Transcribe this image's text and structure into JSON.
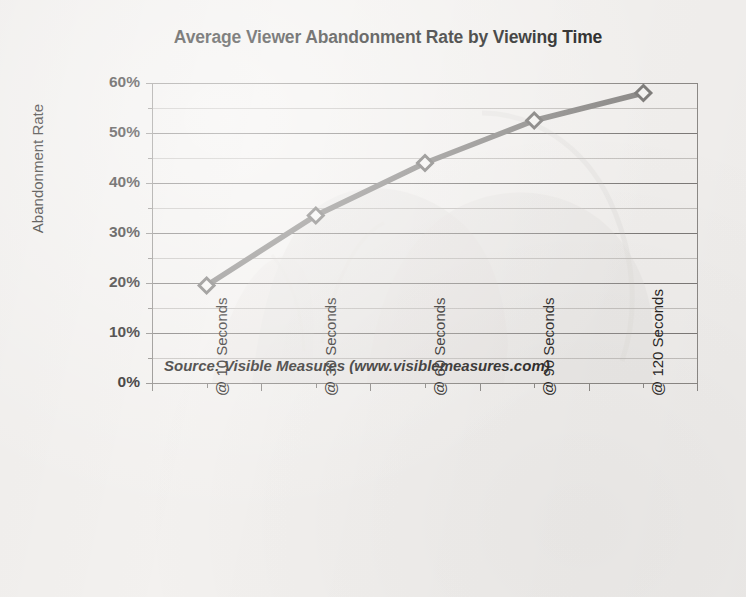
{
  "chart_data": {
    "type": "line",
    "title": "Average Viewer Abandonment Rate by Viewing Time",
    "xlabel": "",
    "ylabel": "Abandonment Rate",
    "categories": [
      "@ 10 Seconds",
      "@ 30 Seconds",
      "@ 60 Seconds",
      "@ 90 Seconds",
      "@ 120 Seconds"
    ],
    "values": [
      19.5,
      33.5,
      44.0,
      52.5,
      58.0
    ],
    "value_unit": "%",
    "ylim": [
      0,
      60
    ],
    "ytick_labels": [
      "0%",
      "10%",
      "20%",
      "30%",
      "40%",
      "50%",
      "60%"
    ],
    "ytick_values": [
      0,
      10,
      20,
      30,
      40,
      50,
      60
    ],
    "minor_ytick_values": [
      5,
      15,
      25,
      35,
      45,
      55
    ],
    "grid": true,
    "minor_grid": true,
    "legend": false,
    "legend_position": "none",
    "marker": "diamond",
    "series": [
      {
        "name": "Average Viewer Abandonment Rate",
        "values": [
          19.5,
          33.5,
          44.0,
          52.5,
          58.0
        ]
      }
    ],
    "annotations": [
      {
        "name": "source-note",
        "text": "Source: Visible Measures (www.visiblemeasures.com)"
      }
    ]
  },
  "colors": {
    "background": "#f3f1ef",
    "series_line": "#8b8987",
    "marker_fill": "#f6f5f3",
    "marker_stroke": "#7d7b79",
    "gridline_major": "#7e7b79",
    "gridline_minor": "#c4c1be",
    "axis": "#8d8a87",
    "text": "#262423",
    "ghost_watermark": "#cfccc8"
  },
  "axes": {
    "y_title": "Abandonment Rate",
    "y_ticks": [
      {
        "label": "60%",
        "value": 60
      },
      {
        "label": "50%",
        "value": 50
      },
      {
        "label": "40%",
        "value": 40
      },
      {
        "label": "30%",
        "value": 30
      },
      {
        "label": "20%",
        "value": 20
      },
      {
        "label": "10%",
        "value": 10
      },
      {
        "label": "0%",
        "value": 0
      }
    ],
    "x_ticks": [
      {
        "label": "@ 10 Seconds"
      },
      {
        "label": "@ 30 Seconds"
      },
      {
        "label": "@ 60 Seconds"
      },
      {
        "label": "@ 90 Seconds"
      },
      {
        "label": "@ 120 Seconds"
      }
    ]
  },
  "notes": {
    "source": "Source: Visible Measures (www.visiblemeasures.com)"
  },
  "header": {
    "title": "Average Viewer Abandonment Rate by Viewing Time"
  }
}
